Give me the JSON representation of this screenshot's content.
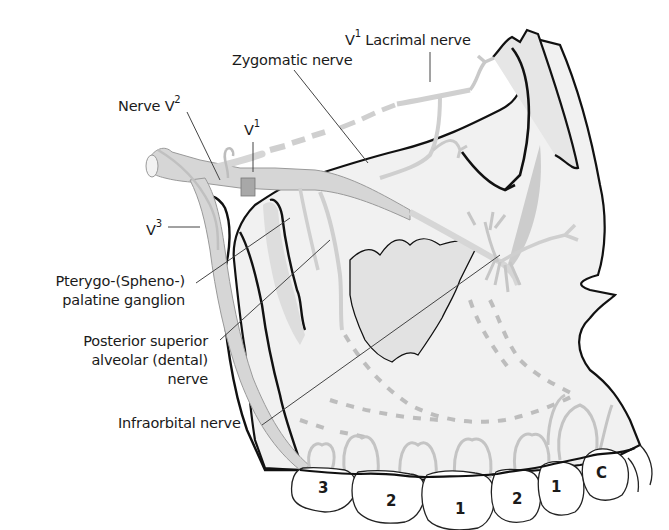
{
  "figure": {
    "labels": {
      "lacrimal": {
        "prefix": "V",
        "sup": "1",
        "text": " Lacrimal nerve"
      },
      "zygomatic": {
        "text": "Zygomatic nerve"
      },
      "nerve_v2": {
        "prefix": "Nerve V",
        "sup": "2"
      },
      "v1": {
        "prefix": "V",
        "sup": "1"
      },
      "v3": {
        "prefix": "V",
        "sup": "3"
      },
      "ganglion": {
        "line1": "Pterygo-(Spheno-)",
        "line2": "palatine ganglion"
      },
      "psa": {
        "line1": "Posterior superior",
        "line2": "alveolar (dental)",
        "line3": "nerve"
      },
      "infraorbital": {
        "text": "Infraorbital nerve"
      }
    },
    "teeth": [
      {
        "id": "third-molar",
        "label": "3"
      },
      {
        "id": "second-molar",
        "label": "2"
      },
      {
        "id": "first-molar",
        "label": "1"
      },
      {
        "id": "second-premolar",
        "label": "2"
      },
      {
        "id": "first-premolar",
        "label": "1"
      },
      {
        "id": "canine",
        "label": "C"
      }
    ],
    "colors": {
      "outline": "#111111",
      "bone_fill": "#ededed",
      "nerve_fill": "#d6d6d6",
      "nerve_stroke": "#9a9a9a",
      "leader": "#444444",
      "ganglion_band": "#a8a8a8"
    }
  }
}
